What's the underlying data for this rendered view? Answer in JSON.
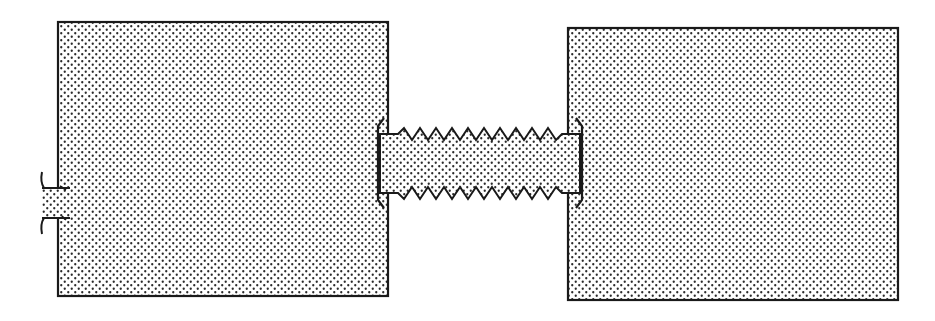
{
  "figure": {
    "type": "patent-style line drawing",
    "background": "#ffffff",
    "stroke_color": "#1a1a1a",
    "stipple_dot_color": "#2a2a2a",
    "components": [
      {
        "id": "left-block",
        "label": "",
        "x": 58,
        "y": 22,
        "w": 330,
        "h": 274
      },
      {
        "id": "left-stub",
        "label": "",
        "x": 42,
        "y": 188,
        "w": 28,
        "h": 30
      },
      {
        "id": "threaded-rod",
        "label": "",
        "x": 378,
        "y": 134,
        "w": 204,
        "h": 59,
        "thread_teeth": 8
      },
      {
        "id": "right-block",
        "label": "",
        "x": 568,
        "y": 28,
        "w": 330,
        "h": 272
      }
    ]
  }
}
